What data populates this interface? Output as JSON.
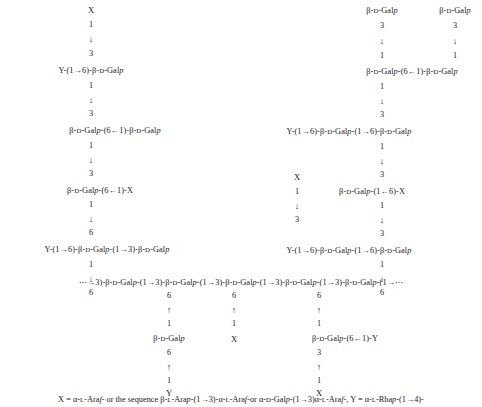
{
  "figure": {
    "type": "polysaccharide-structure-diagram",
    "background_color": "#ffffff",
    "text_color": "#1b1b1b"
  },
  "glyphs": {
    "arrow_down": "↓",
    "arrow_up": "↑",
    "arrow_right": "→",
    "arrow_left": "←",
    "ellipsis": "⋯"
  },
  "nodes": [
    {
      "id": "n1",
      "name": "upper-left-branch-terminal-x",
      "text": "X",
      "kind": "placeholder",
      "x": 91,
      "y": 10
    },
    {
      "id": "n2",
      "name": "upper-left-branch-position-1",
      "text": "1",
      "kind": "numeral",
      "x": 91,
      "y": 25
    },
    {
      "id": "n3",
      "name": "upper-left-branch-arrow-down",
      "text": "↓",
      "kind": "arrow",
      "x": 91,
      "y": 39
    },
    {
      "id": "n4",
      "name": "upper-left-branch-position-3",
      "text": "3",
      "kind": "numeral",
      "x": 91,
      "y": 54
    },
    {
      "id": "n5",
      "name": "left-chain-residue-1",
      "text": "Y-(1→6)-β-D-Galp",
      "kind": "residue",
      "x": 91,
      "y": 71
    },
    {
      "id": "n6",
      "name": "left-chain-position-1-a",
      "text": "1",
      "kind": "numeral",
      "x": 91,
      "y": 86
    },
    {
      "id": "n7",
      "name": "left-chain-arrow-down-a",
      "text": "↓",
      "kind": "arrow",
      "x": 91,
      "y": 100
    },
    {
      "id": "n8",
      "name": "left-chain-position-3-a",
      "text": "3",
      "kind": "numeral",
      "x": 91,
      "y": 114
    },
    {
      "id": "n9",
      "name": "left-chain-residue-2",
      "text": "β-D-Galp-(6←1)-β-D-Galp",
      "kind": "residue",
      "x": 115,
      "y": 131
    },
    {
      "id": "n10",
      "name": "left-chain-position-1-b",
      "text": "1",
      "kind": "numeral",
      "x": 91,
      "y": 146
    },
    {
      "id": "n11",
      "name": "left-chain-arrow-down-b",
      "text": "↓",
      "kind": "arrow",
      "x": 91,
      "y": 160
    },
    {
      "id": "n12",
      "name": "left-chain-position-3-b",
      "text": "3",
      "kind": "numeral",
      "x": 91,
      "y": 174
    },
    {
      "id": "n13",
      "name": "left-chain-residue-3",
      "text": "β-D-Galp-(6←1)-X",
      "kind": "residue",
      "x": 100,
      "y": 191
    },
    {
      "id": "n14",
      "name": "left-chain-position-1-c",
      "text": "1",
      "kind": "numeral",
      "x": 91,
      "y": 205
    },
    {
      "id": "n15",
      "name": "left-chain-arrow-down-c",
      "text": "↓",
      "kind": "arrow",
      "x": 91,
      "y": 219
    },
    {
      "id": "n16",
      "name": "left-chain-position-6-a",
      "text": "6",
      "kind": "numeral",
      "x": 91,
      "y": 233
    },
    {
      "id": "n17",
      "name": "left-chain-residue-4",
      "text": "Y-(1→6)-β-D-Galp-(1→3)-β-D-Galp",
      "kind": "residue",
      "x": 107,
      "y": 250
    },
    {
      "id": "n18",
      "name": "left-chain-position-1-d",
      "text": "1",
      "kind": "numeral",
      "x": 91,
      "y": 265
    },
    {
      "id": "n19",
      "name": "left-chain-arrow-down-d",
      "text": "↓",
      "kind": "arrow",
      "x": 91,
      "y": 279
    },
    {
      "id": "n20",
      "name": "left-chain-position-6-b",
      "text": "6",
      "kind": "numeral",
      "x": 91,
      "y": 293
    },
    {
      "id": "n21",
      "name": "upper-right-branch-terminal-galp-a",
      "text": "β-D-Galp",
      "kind": "residue",
      "x": 382,
      "y": 11
    },
    {
      "id": "n22",
      "name": "upper-right-branch-position-3-a",
      "text": "3",
      "kind": "numeral",
      "x": 382,
      "y": 26
    },
    {
      "id": "n23",
      "name": "upper-right-branch-arrow-down-a",
      "text": "↓",
      "kind": "arrow",
      "x": 382,
      "y": 41
    },
    {
      "id": "n24",
      "name": "upper-right-branch-position-1-a",
      "text": "1",
      "kind": "numeral",
      "x": 382,
      "y": 56
    },
    {
      "id": "n25",
      "name": "upper-far-right-branch-terminal-galp",
      "text": "β-D-Galp",
      "kind": "residue",
      "x": 455,
      "y": 11
    },
    {
      "id": "n26",
      "name": "upper-far-right-branch-position-3",
      "text": "3",
      "kind": "numeral",
      "x": 455,
      "y": 26
    },
    {
      "id": "n27",
      "name": "upper-far-right-branch-arrow-down",
      "text": "↓",
      "kind": "arrow",
      "x": 455,
      "y": 41
    },
    {
      "id": "n28",
      "name": "upper-far-right-branch-position-1",
      "text": "1",
      "kind": "numeral",
      "x": 455,
      "y": 56
    },
    {
      "id": "n29",
      "name": "right-chain-residue-1",
      "text": "β-D-Galp-(6←1)-β-D-Galp",
      "kind": "residue",
      "x": 412,
      "y": 72
    },
    {
      "id": "n30",
      "name": "right-chain-position-1-a",
      "text": "1",
      "kind": "numeral",
      "x": 382,
      "y": 87
    },
    {
      "id": "n31",
      "name": "right-chain-arrow-down-a",
      "text": "↓",
      "kind": "arrow",
      "x": 382,
      "y": 101
    },
    {
      "id": "n32",
      "name": "right-chain-position-3-a",
      "text": "3",
      "kind": "numeral",
      "x": 382,
      "y": 115
    },
    {
      "id": "n33",
      "name": "right-chain-residue-2",
      "text": "Y-(1→6)-β-D-Galp-(1→6)-β-D-Galp",
      "kind": "residue",
      "x": 349,
      "y": 132
    },
    {
      "id": "n34",
      "name": "right-chain-position-1-b",
      "text": "1",
      "kind": "numeral",
      "x": 382,
      "y": 147
    },
    {
      "id": "n35",
      "name": "right-chain-arrow-down-b",
      "text": "↓",
      "kind": "arrow",
      "x": 382,
      "y": 161
    },
    {
      "id": "n36",
      "name": "right-chain-position-3-b",
      "text": "3",
      "kind": "numeral",
      "x": 382,
      "y": 175
    },
    {
      "id": "n37",
      "name": "right-chain-residue-3",
      "text": "β-D-Galp-(1←6)-X",
      "kind": "residue",
      "x": 372,
      "y": 192
    },
    {
      "id": "n38",
      "name": "right-chain-position-1-c",
      "text": "1",
      "kind": "numeral",
      "x": 382,
      "y": 206
    },
    {
      "id": "n39",
      "name": "right-chain-arrow-down-c",
      "text": "↓",
      "kind": "arrow",
      "x": 382,
      "y": 220
    },
    {
      "id": "n40",
      "name": "right-chain-position-3-c",
      "text": "3",
      "kind": "numeral",
      "x": 382,
      "y": 234
    },
    {
      "id": "n41",
      "name": "right-chain-residue-4",
      "text": "Y-(1→6)-β-D-Galp-(1→6)-β-D-Galp",
      "kind": "residue",
      "x": 349,
      "y": 251
    },
    {
      "id": "n42",
      "name": "right-chain-position-1-d",
      "text": "1",
      "kind": "numeral",
      "x": 382,
      "y": 265
    },
    {
      "id": "n43",
      "name": "right-chain-arrow-down-d",
      "text": "↓",
      "kind": "arrow",
      "x": 382,
      "y": 279
    },
    {
      "id": "n44",
      "name": "right-chain-position-6",
      "text": "6",
      "kind": "numeral",
      "x": 382,
      "y": 293
    },
    {
      "id": "n45",
      "name": "middle-branch-terminal-x",
      "text": "X",
      "kind": "placeholder",
      "x": 297,
      "y": 177
    },
    {
      "id": "n46",
      "name": "middle-branch-position-1",
      "text": "1",
      "kind": "numeral",
      "x": 297,
      "y": 192
    },
    {
      "id": "n47",
      "name": "middle-branch-arrow-down",
      "text": "↓",
      "kind": "arrow",
      "x": 297,
      "y": 206
    },
    {
      "id": "n48",
      "name": "middle-branch-position-3",
      "text": "3",
      "kind": "numeral",
      "x": 297,
      "y": 220
    },
    {
      "id": "n49",
      "name": "backbone-chain",
      "text": "⋯→3)-β-D-Galp-(1→3)-β-D-Galp-(1→3)-β-D-Galp-(1→3)-β-D-Galp-(1→3)-β-D-Galp-(1→⋯",
      "kind": "residue",
      "x": 241,
      "y": 283
    },
    {
      "id": "n50",
      "name": "lower-branch-1-position-6",
      "text": "6",
      "kind": "numeral",
      "x": 169,
      "y": 296
    },
    {
      "id": "n51",
      "name": "lower-branch-1-arrow-up",
      "text": "↑",
      "kind": "arrow",
      "x": 169,
      "y": 310
    },
    {
      "id": "n52",
      "name": "lower-branch-1-position-1",
      "text": "1",
      "kind": "numeral",
      "x": 169,
      "y": 324
    },
    {
      "id": "n53",
      "name": "lower-branch-1-residue",
      "text": "β-D-Galp",
      "kind": "residue",
      "x": 169,
      "y": 339
    },
    {
      "id": "n54",
      "name": "lower-branch-1-position-6-b",
      "text": "6",
      "kind": "numeral",
      "x": 169,
      "y": 353
    },
    {
      "id": "n55",
      "name": "lower-branch-1-arrow-up-b",
      "text": "↑",
      "kind": "arrow",
      "x": 169,
      "y": 367
    },
    {
      "id": "n56",
      "name": "lower-branch-1-position-1-b",
      "text": "1",
      "kind": "numeral",
      "x": 169,
      "y": 381
    },
    {
      "id": "n57",
      "name": "lower-branch-1-terminal-y",
      "text": "Y",
      "kind": "placeholder",
      "x": 169,
      "y": 393
    },
    {
      "id": "n58",
      "name": "lower-branch-2-position-6",
      "text": "6",
      "kind": "numeral",
      "x": 234,
      "y": 296
    },
    {
      "id": "n59",
      "name": "lower-branch-2-arrow-up",
      "text": "↑",
      "kind": "arrow",
      "x": 234,
      "y": 310
    },
    {
      "id": "n60",
      "name": "lower-branch-2-position-1",
      "text": "1",
      "kind": "numeral",
      "x": 234,
      "y": 324
    },
    {
      "id": "n61",
      "name": "lower-branch-2-terminal-x",
      "text": "X",
      "kind": "placeholder",
      "x": 234,
      "y": 339
    },
    {
      "id": "n62",
      "name": "lower-branch-3-position-6",
      "text": "6",
      "kind": "numeral",
      "x": 319,
      "y": 296
    },
    {
      "id": "n63",
      "name": "lower-branch-3-arrow-up",
      "text": "↑",
      "kind": "arrow",
      "x": 319,
      "y": 310
    },
    {
      "id": "n64",
      "name": "lower-branch-3-position-1",
      "text": "1",
      "kind": "numeral",
      "x": 319,
      "y": 324
    },
    {
      "id": "n65",
      "name": "lower-branch-3-residue",
      "text": "β-D-Galp-(6←1)-Y",
      "kind": "residue",
      "x": 345,
      "y": 339
    },
    {
      "id": "n66",
      "name": "lower-branch-3-position-3",
      "text": "3",
      "kind": "numeral",
      "x": 319,
      "y": 353
    },
    {
      "id": "n67",
      "name": "lower-branch-3-arrow-up-b",
      "text": "↑",
      "kind": "arrow",
      "x": 319,
      "y": 367
    },
    {
      "id": "n68",
      "name": "lower-branch-3-position-1-b",
      "text": "1",
      "kind": "numeral",
      "x": 319,
      "y": 381
    },
    {
      "id": "n69",
      "name": "lower-branch-3-terminal-x",
      "text": "X",
      "kind": "placeholder",
      "x": 319,
      "y": 393
    }
  ],
  "legend": {
    "name": "definitions-legend",
    "text": "X = α-L-Araf- or the sequence β-L-Arap-(1→3)-α-L-Araf-or α-D-Galp-(1→3)α-L-Araf-, Y = α-L-Rhap-(1→4)-",
    "x": 241,
    "y": 400,
    "definitions": [
      {
        "symbol": "X",
        "meaning": "α-L-Araf- or the sequence β-L-Arap-(1→3)-α-L-Araf-or α-D-Galp-(1→3)α-L-Araf-"
      },
      {
        "symbol": "Y",
        "meaning": "α-L-Rhap-(1→4)-"
      }
    ]
  }
}
